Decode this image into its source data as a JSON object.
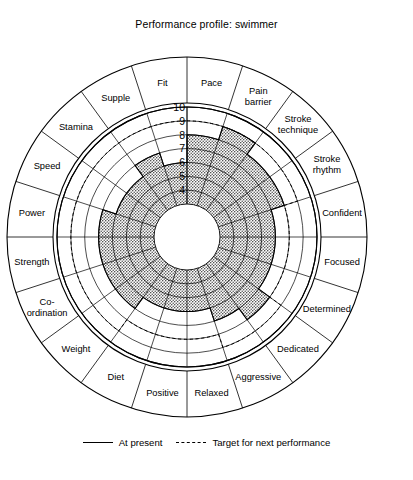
{
  "chart_data": {
    "type": "radar",
    "title": "Performance profile: swimmer",
    "rlim": [
      3,
      10
    ],
    "r_ticks": [
      10,
      9,
      8,
      7,
      6,
      5,
      4
    ],
    "hole_value": 3,
    "grid": true,
    "legend_position": "bottom",
    "categories": [
      "Pace",
      "Pain barrier",
      "Stroke technique",
      "Stroke rhythm",
      "Confident",
      "Focused",
      "Determined",
      "Dedicated",
      "Aggressive",
      "Relaxed",
      "Positive",
      "Diet",
      "Weight",
      "Co-ordination",
      "Strength",
      "Power",
      "Speed",
      "Stamina",
      "Supple",
      "Fit"
    ],
    "series": [
      {
        "name": "At present",
        "style": "solid",
        "fill": "hatched",
        "values": [
          8,
          9,
          8,
          8,
          7,
          7,
          7,
          8,
          7,
          6,
          6,
          6,
          7,
          7,
          7,
          7,
          6,
          6,
          7,
          6
        ]
      },
      {
        "name": "Target for next performance",
        "style": "dashed",
        "fill": "none",
        "values": [
          9,
          9,
          9,
          9,
          8,
          8,
          8,
          9,
          9,
          8,
          8,
          8,
          9,
          9,
          9,
          9,
          9,
          9,
          9,
          9
        ]
      }
    ]
  },
  "legend": {
    "present_label": "At present",
    "target_label": "Target for next performance"
  },
  "colors": {
    "line": "#000000",
    "hatch": "#5a5a5a",
    "background": "#ffffff"
  }
}
